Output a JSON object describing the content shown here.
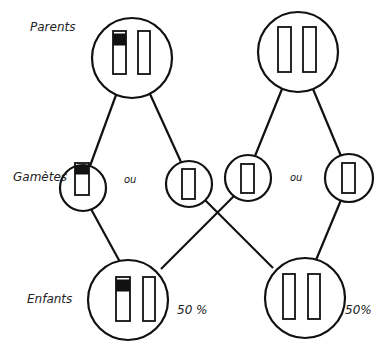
{
  "labels": {
    "parents": "Parents",
    "gametes": "Gamètes",
    "children": "Enfants",
    "or_left": "ou",
    "or_right": "ou",
    "pct_left": "50 %",
    "pct_right": "50%"
  },
  "colors": {
    "stroke": "#111111",
    "fill_mutant": "#111111",
    "background": "#ffffff"
  },
  "nodes": {
    "parent_left": {
      "cx": 132,
      "cy": 58,
      "r": 40,
      "chromosomes": [
        {
          "x": 113,
          "y": 31,
          "w": 13,
          "h": 43,
          "marked": true
        },
        {
          "x": 138,
          "y": 31,
          "w": 12,
          "h": 43,
          "marked": false
        }
      ]
    },
    "parent_right": {
      "cx": 298,
      "cy": 52,
      "r": 40,
      "chromosomes": [
        {
          "x": 278,
          "y": 27,
          "w": 13,
          "h": 45,
          "marked": false
        },
        {
          "x": 303,
          "y": 27,
          "w": 13,
          "h": 45,
          "marked": false
        }
      ]
    },
    "gamete_1": {
      "cx": 83,
      "cy": 188,
      "r": 23,
      "chromosomes": [
        {
          "x": 75,
          "y": 163,
          "w": 14,
          "h": 32,
          "marked": true
        }
      ]
    },
    "gamete_2": {
      "cx": 189,
      "cy": 184,
      "r": 23,
      "chromosomes": [
        {
          "x": 182,
          "y": 169,
          "w": 13,
          "h": 30,
          "marked": false
        }
      ]
    },
    "gamete_3": {
      "cx": 248,
      "cy": 178,
      "r": 23,
      "chromosomes": [
        {
          "x": 241,
          "y": 164,
          "w": 13,
          "h": 29,
          "marked": false
        }
      ]
    },
    "gamete_4": {
      "cx": 349,
      "cy": 178,
      "r": 24,
      "chromosomes": [
        {
          "x": 342,
          "y": 163,
          "w": 13,
          "h": 30,
          "marked": false
        }
      ]
    },
    "child_left": {
      "cx": 128,
      "cy": 300,
      "r": 40,
      "chromosomes": [
        {
          "x": 116,
          "y": 277,
          "w": 14,
          "h": 44,
          "marked": true
        },
        {
          "x": 143,
          "y": 277,
          "w": 12,
          "h": 44,
          "marked": false
        }
      ]
    },
    "child_right": {
      "cx": 305,
      "cy": 298,
      "r": 40,
      "chromosomes": [
        {
          "x": 283,
          "y": 274,
          "w": 12,
          "h": 45,
          "marked": false
        },
        {
          "x": 308,
          "y": 274,
          "w": 12,
          "h": 45,
          "marked": false
        }
      ]
    }
  }
}
